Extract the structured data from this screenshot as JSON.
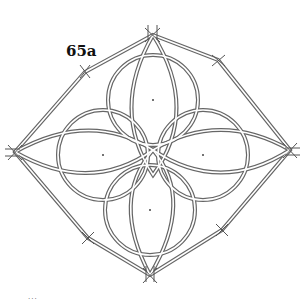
{
  "figure": {
    "label": "65a",
    "caption": "...",
    "stroke_color": "#555555",
    "background": "#ffffff"
  }
}
